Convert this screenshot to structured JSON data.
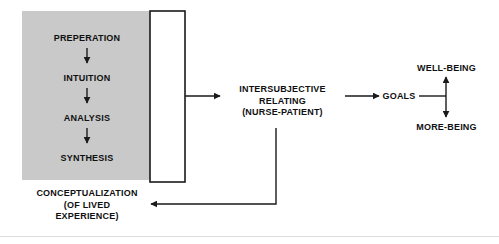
{
  "diagram": {
    "colors": {
      "panel_fill": "#c9c9c9",
      "stroke": "#1a1a1a",
      "background": "#ffffff",
      "baseline": "#dcdcdc"
    },
    "process_panel": {
      "stages": [
        {
          "id": "preperation",
          "label": "PREPERATION"
        },
        {
          "id": "intuition",
          "label": "INTUITION"
        },
        {
          "id": "analysis",
          "label": "ANALYSIS"
        },
        {
          "id": "synthesis",
          "label": "SYNTHESIS"
        }
      ]
    },
    "nodes": {
      "conceptualization": {
        "label": "CONCEPTUALIZATION\n(OF LIVED\nEXPERIENCE)"
      },
      "intersubjective": {
        "label": "INTERSUBJECTIVE\nRELATING\n(NURSE-PATIENT)"
      },
      "goals": {
        "label": "GOALS"
      },
      "well_being": {
        "label": "WELL-BEING"
      },
      "more_being": {
        "label": "MORE-BEING"
      }
    }
  }
}
